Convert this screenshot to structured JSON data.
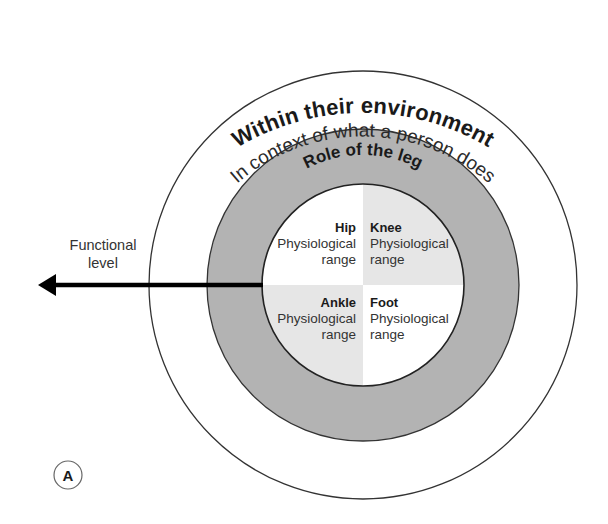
{
  "diagram": {
    "rings": {
      "outer": {
        "label": "Within their environment"
      },
      "middle": {
        "label": "In context of what a person does"
      },
      "gray": {
        "label": "Role of the leg"
      }
    },
    "quadrants": [
      {
        "id": "hip",
        "title": "Hip",
        "line1": "Physiological",
        "line2": "range"
      },
      {
        "id": "knee",
        "title": "Knee",
        "line1": "Physiological",
        "line2": "range"
      },
      {
        "id": "ankle",
        "title": "Ankle",
        "line1": "Physiological",
        "line2": "range"
      },
      {
        "id": "foot",
        "title": "Foot",
        "line1": "Physiological",
        "line2": "range"
      }
    ],
    "arrow": {
      "line1": "Functional",
      "line2": "level"
    },
    "panel_label": "A",
    "colors": {
      "gray_ring": "#b3b3b3",
      "quadrant_shaded": "#e6e6e6",
      "quadrant_white": "#ffffff",
      "stroke": "#333333",
      "arrow": "#000000"
    }
  }
}
